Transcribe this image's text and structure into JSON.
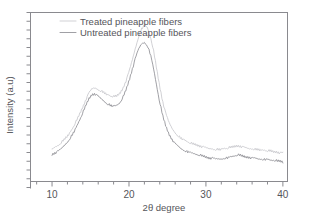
{
  "chart_data": {
    "type": "line",
    "title": "",
    "subtitle": "",
    "xlabel": "2θ degree",
    "ylabel": "Intensity (a.u)",
    "xlim": [
      7.2,
      40.6
    ],
    "ylim": [
      0,
      100
    ],
    "xticks": [
      10,
      20,
      30,
      40
    ],
    "xtick_labels": [
      "10",
      "20",
      "30",
      "40"
    ],
    "x_minor_tick_step": 2,
    "yticks_count": 20,
    "ytick_labels": [],
    "grid": false,
    "legend_position": "top-left",
    "axis_color": "#8a8a8f",
    "frame": "box",
    "annotations": [],
    "series": [
      {
        "name": "Treated pineapple fibers",
        "color": "#c9c9cd",
        "x": [
          10.0,
          10.4,
          10.8,
          11.2,
          11.6,
          12.0,
          12.4,
          12.8,
          13.2,
          13.6,
          14.0,
          14.4,
          14.8,
          15.2,
          15.6,
          16.0,
          16.4,
          16.8,
          17.2,
          17.6,
          18.0,
          18.4,
          18.8,
          19.2,
          19.6,
          20.0,
          20.4,
          20.8,
          21.2,
          21.6,
          22.0,
          22.4,
          22.8,
          23.2,
          23.6,
          24.0,
          24.4,
          24.8,
          25.2,
          25.6,
          26.0,
          26.4,
          26.8,
          27.2,
          27.6,
          28.0,
          28.4,
          28.8,
          29.2,
          29.6,
          30.0,
          30.4,
          30.8,
          31.2,
          31.6,
          32.0,
          32.4,
          32.8,
          33.2,
          33.6,
          34.0,
          34.4,
          34.8,
          35.2,
          35.6,
          36.0,
          36.4,
          36.8,
          37.2,
          37.6,
          38.0,
          38.4,
          38.8,
          39.2,
          39.6,
          40.0
        ],
        "y": [
          19.0,
          20.5,
          21.5,
          23.0,
          25.0,
          27.0,
          29.5,
          32.5,
          36.0,
          40.0,
          44.0,
          48.5,
          52.5,
          55.0,
          55.5,
          54.5,
          53.5,
          52.5,
          51.5,
          50.5,
          50.0,
          50.5,
          52.0,
          55.0,
          59.5,
          65.0,
          71.5,
          78.5,
          85.0,
          90.0,
          92.5,
          91.0,
          85.5,
          77.0,
          66.5,
          56.0,
          47.0,
          40.0,
          35.0,
          31.5,
          29.0,
          27.0,
          25.5,
          24.5,
          23.5,
          22.5,
          22.0,
          21.5,
          21.0,
          20.5,
          20.0,
          19.5,
          19.5,
          19.0,
          19.0,
          19.0,
          19.5,
          19.5,
          20.0,
          20.5,
          21.0,
          21.0,
          20.5,
          20.0,
          19.5,
          19.5,
          19.0,
          19.0,
          18.5,
          18.5,
          18.0,
          18.0,
          17.5,
          17.5,
          17.0,
          17.0
        ]
      },
      {
        "name": "Untreated pineapple fibers",
        "color": "#8f8f95",
        "x": [
          10.0,
          10.4,
          10.8,
          11.2,
          11.6,
          12.0,
          12.4,
          12.8,
          13.2,
          13.6,
          14.0,
          14.4,
          14.8,
          15.2,
          15.6,
          16.0,
          16.4,
          16.8,
          17.2,
          17.6,
          18.0,
          18.4,
          18.8,
          19.2,
          19.6,
          20.0,
          20.4,
          20.8,
          21.2,
          21.6,
          22.0,
          22.4,
          22.8,
          23.2,
          23.6,
          24.0,
          24.4,
          24.8,
          25.2,
          25.6,
          26.0,
          26.4,
          26.8,
          27.2,
          27.6,
          28.0,
          28.4,
          28.8,
          29.2,
          29.6,
          30.0,
          30.4,
          30.8,
          31.2,
          31.6,
          32.0,
          32.4,
          32.8,
          33.2,
          33.6,
          34.0,
          34.4,
          34.8,
          35.2,
          35.6,
          36.0,
          36.4,
          36.8,
          37.2,
          37.6,
          38.0,
          38.4,
          38.8,
          39.2,
          39.6,
          40.0
        ],
        "y": [
          16.0,
          17.0,
          18.0,
          19.5,
          21.5,
          23.5,
          26.0,
          29.0,
          32.5,
          36.5,
          40.5,
          45.0,
          49.0,
          51.5,
          52.0,
          50.5,
          49.0,
          47.5,
          46.0,
          45.0,
          44.5,
          45.0,
          46.5,
          49.5,
          54.0,
          59.5,
          66.0,
          72.5,
          78.0,
          81.5,
          82.5,
          80.5,
          75.0,
          66.5,
          56.5,
          46.5,
          38.5,
          32.5,
          28.0,
          25.0,
          22.5,
          21.0,
          19.5,
          18.5,
          17.5,
          17.0,
          16.5,
          16.0,
          15.5,
          15.0,
          14.5,
          14.0,
          14.0,
          13.5,
          13.5,
          13.5,
          14.0,
          14.0,
          14.5,
          15.0,
          15.5,
          15.5,
          15.0,
          14.5,
          14.5,
          14.0,
          14.0,
          13.5,
          13.5,
          13.0,
          13.0,
          12.5,
          12.5,
          12.0,
          12.0,
          11.5
        ]
      }
    ]
  },
  "legend": {
    "items": [
      {
        "label": "Treated pineapple fibers",
        "color": "#c9c9cd"
      },
      {
        "label": "Untreated pineapple fibers",
        "color": "#8f8f95"
      }
    ]
  },
  "axes": {
    "x_label": "2θ degree",
    "y_label": "Intensity (a.u)",
    "x_tick_labels": [
      "10",
      "20",
      "30",
      "40"
    ]
  }
}
